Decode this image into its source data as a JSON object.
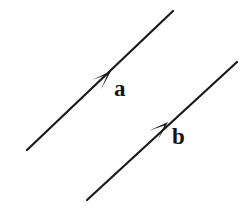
{
  "figure": {
    "background_color": "#ffffff",
    "stroke_color": "#1a1a1a",
    "label_color": "#121212",
    "width": 242,
    "height": 208
  },
  "vectors": [
    {
      "name": "a",
      "label": "a",
      "label_x": 114,
      "label_y": 77,
      "tail": {
        "x": 27,
        "y": 150
      },
      "head": {
        "x": 173,
        "y": 11
      },
      "arrowhead": {
        "x": 111,
        "y": 71
      },
      "stroke_width": 2.2,
      "direction_deg": 43.6
    },
    {
      "name": "b",
      "label": "b",
      "label_x": 172,
      "label_y": 125,
      "tail": {
        "x": 87,
        "y": 200
      },
      "head": {
        "x": 237,
        "y": 62
      },
      "arrowhead": {
        "x": 168,
        "y": 122
      },
      "stroke_width": 2.2,
      "direction_deg": 42.6
    }
  ],
  "arrowhead_style": {
    "length": 20,
    "half_width": 6.5,
    "notch": 5
  }
}
